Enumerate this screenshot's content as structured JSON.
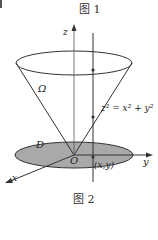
{
  "top_caption": "图 1",
  "bottom_caption": "图 2",
  "labels": {
    "z_axis": "z",
    "y_axis": "y",
    "x_axis": "x",
    "omega": "Ω",
    "region": "D",
    "origin": "O",
    "point": "(x,y)",
    "surface_eq": "z² = x² + y²"
  },
  "colors": {
    "line": "#333333",
    "disk_fill": "#a9a9a9",
    "background": "#ffffff"
  }
}
